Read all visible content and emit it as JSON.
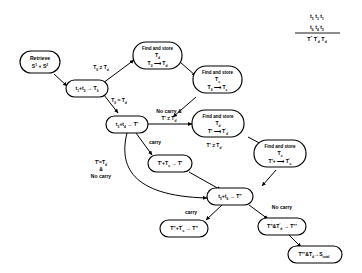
{
  "diagram": {
    "formula": {
      "row1": "t5 t3 t1",
      "row2": "t6 t4 t2",
      "result": "T\" T'd Td",
      "row1_parts": [
        {
          "base": "t",
          "sub": "5"
        },
        {
          "base": "t",
          "sub": "3"
        },
        {
          "base": "t",
          "sub": "1"
        }
      ],
      "row2_parts": [
        {
          "base": "t",
          "sub": "6"
        },
        {
          "base": "t",
          "sub": "4"
        },
        {
          "base": "t",
          "sub": "2"
        }
      ],
      "result_parts": [
        {
          "base": "T",
          "sup": "\""
        },
        {
          "base": "T",
          "sup": "'",
          "sub": "d"
        },
        {
          "base": "T",
          "sub": "d"
        }
      ]
    },
    "nodes": [
      {
        "id": "retrieve",
        "line1": "Retrieve",
        "line2": "S¹ + S²"
      },
      {
        "id": "t1t2",
        "line1": "t₁+t₂ → T₀"
      },
      {
        "id": "find_td_0",
        "line1": "Find and store",
        "line2": "T_d",
        "line3": "T₀ →  T_d"
      },
      {
        "id": "find_tc_0",
        "line1": "Find and store",
        "line2": "T_c",
        "line3": "T₀ →  T_c"
      },
      {
        "id": "t3t4",
        "line1": "t₃+t₄ → T'"
      },
      {
        "id": "find_td_1",
        "line1": "Find and store",
        "line2": "T_d",
        "line3": "T' →  T'_d"
      },
      {
        "id": "find_tc_1",
        "line1": "Find and store",
        "line2": "T_c",
        "line3": "T'+ →  T'_c"
      },
      {
        "id": "tprime_tc",
        "line1": "T'+T_c → T'"
      },
      {
        "id": "t5t6",
        "line1": "t₅+t₆ → T\""
      },
      {
        "id": "t2prime_tc",
        "line1": "T\"+T'_c → T\""
      },
      {
        "id": "t2prime_td",
        "line1": "T\"& T'_d → T\"'"
      },
      {
        "id": "final",
        "line1": "T\"'&T_d → S_total"
      }
    ],
    "edge_labels": [
      {
        "id": "td_neq",
        "text": "T₀ ≠ T_d"
      },
      {
        "id": "td_eq",
        "text": "T₀ = T_d"
      },
      {
        "id": "nocarry_neq",
        "line1": "No carry &",
        "line2": "T' ≠ T_d"
      },
      {
        "id": "carry_1",
        "text": "carry"
      },
      {
        "id": "tprime_neq_td",
        "text": "T' ≠ T_d"
      },
      {
        "id": "tprime_eq_nocarry",
        "line1": "T'=T_d",
        "line2": "&",
        "line3": "No carry"
      },
      {
        "id": "carry_2",
        "text": "carry"
      },
      {
        "id": "nocarry_2",
        "text": "No carry"
      }
    ]
  }
}
